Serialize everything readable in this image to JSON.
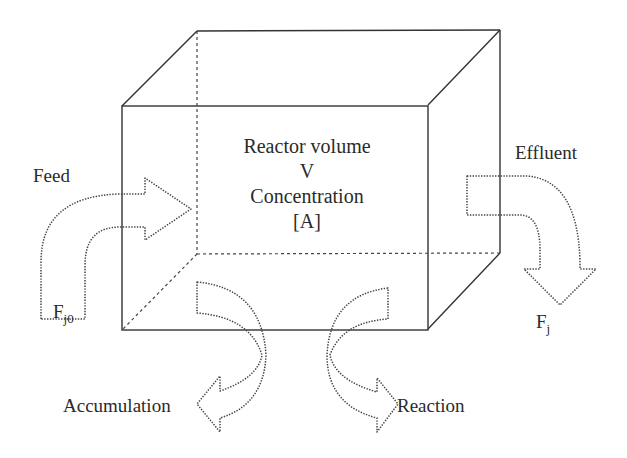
{
  "diagram": {
    "reactor": {
      "line1": "Reactor volume",
      "line2": "V",
      "line3": "Concentration",
      "line4": "[A]"
    },
    "flows": {
      "feed": {
        "label": "Feed",
        "symbol_main": "F",
        "symbol_sub": "j0"
      },
      "effluent": {
        "label": "Effluent",
        "symbol_main": "F",
        "symbol_sub": "j"
      },
      "accumulation": {
        "label": "Accumulation"
      },
      "reaction": {
        "label": "Reaction"
      }
    },
    "colors": {
      "line": "#333333",
      "text": "#2a2a2a",
      "background": "#ffffff"
    }
  }
}
